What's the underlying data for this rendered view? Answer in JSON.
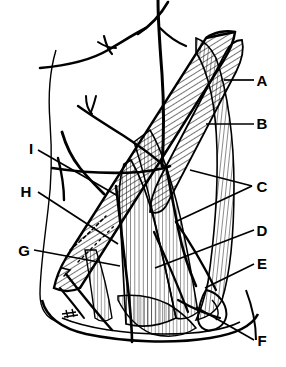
{
  "figure": {
    "background_color": "#ffffff",
    "ink_color": "#000000",
    "width": 286,
    "height": 367,
    "signature_mark": "artist-signature"
  },
  "labels": [
    {
      "id": "A",
      "text": "A",
      "x": 262,
      "y": 86,
      "side": "right",
      "leader": [
        [
          224,
          80
        ],
        [
          254,
          80
        ]
      ]
    },
    {
      "id": "B",
      "text": "B",
      "x": 262,
      "y": 129,
      "side": "right",
      "leader": [
        [
          206,
          124
        ],
        [
          254,
          124
        ]
      ]
    },
    {
      "id": "C",
      "text": "C",
      "x": 262,
      "y": 189,
      "side": "right",
      "leader_v": [
        [
          [
            190,
            170
          ],
          [
            252,
            186
          ]
        ],
        [
          [
            175,
            222
          ],
          [
            252,
            186
          ]
        ]
      ]
    },
    {
      "id": "D",
      "text": "D",
      "x": 262,
      "y": 235,
      "side": "right",
      "leader": [
        [
          155,
          268
        ],
        [
          254,
          230
        ]
      ]
    },
    {
      "id": "E",
      "text": "E",
      "x": 262,
      "y": 268,
      "side": "right",
      "leader": [
        [
          205,
          288
        ],
        [
          254,
          264
        ]
      ]
    },
    {
      "id": "F",
      "text": "F",
      "x": 262,
      "y": 345,
      "side": "right",
      "leader": [
        [
          196,
          307
        ],
        [
          254,
          340
        ]
      ]
    },
    {
      "id": "G",
      "text": "G",
      "x": 24,
      "y": 255,
      "side": "left",
      "leader": [
        [
          34,
          250
        ],
        [
          120,
          266
        ]
      ]
    },
    {
      "id": "H",
      "text": "H",
      "x": 26,
      "y": 196,
      "side": "left",
      "leader": [
        [
          38,
          192
        ],
        [
          118,
          244
        ]
      ]
    },
    {
      "id": "I",
      "text": "I",
      "x": 31,
      "y": 153,
      "side": "left",
      "leader": [
        [
          38,
          150
        ],
        [
          118,
          196
        ]
      ]
    }
  ],
  "structures": {
    "hatched_band": "sternocleidomastoid-muscle-band",
    "vertical_striated_muscles": "deep-cervical-muscle-group",
    "vessels": "vessel-nerve-lines",
    "outline": "neck-jaw-contour",
    "clavicle_loop": "clavicle-loop"
  }
}
